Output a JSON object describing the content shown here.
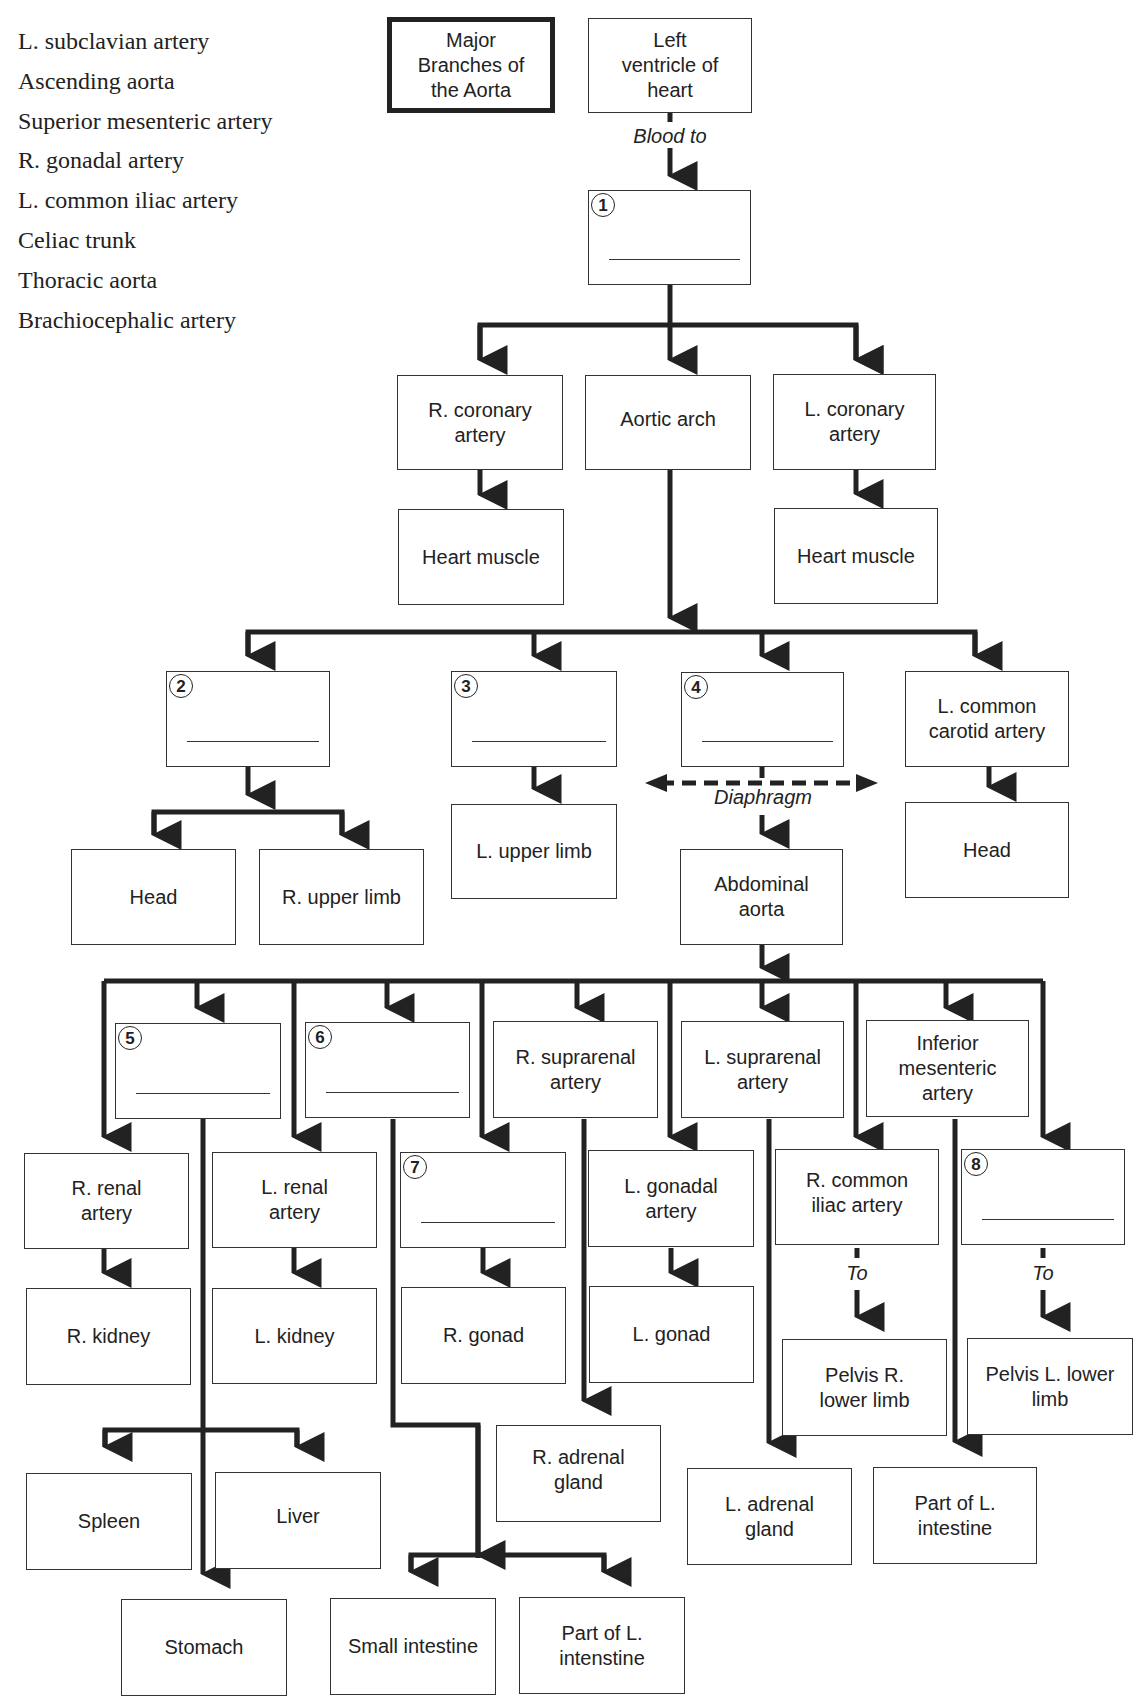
{
  "word_bank": [
    "L. subclavian artery",
    "Ascending aorta",
    "Superior mesenteric artery",
    "R. gonadal artery",
    "L. common iliac artery",
    "Celiac trunk",
    "Thoracic aorta",
    "Brachiocephalic artery"
  ],
  "title": "Major Branches of the Aorta",
  "labels": {
    "blood_to": "Blood to",
    "diaphragm": "Diaphragm",
    "to_right": "To",
    "to_left": "To"
  },
  "boxes": {
    "left_ventricle": "Left ventricle of heart",
    "r_coronary": "R. coronary artery",
    "aortic_arch": "Aortic arch",
    "l_coronary": "L. coronary artery",
    "heart_muscle_r": "Heart muscle",
    "heart_muscle_l": "Heart muscle",
    "l_common_carotid": "L. common carotid artery",
    "head_l": "Head",
    "head_r": "Head",
    "r_upper_limb": "R. upper limb",
    "l_upper_limb": "L. upper limb",
    "abdominal_aorta": "Abdominal aorta",
    "r_suprarenal": "R. suprarenal artery",
    "l_suprarenal": "L. suprarenal artery",
    "inferior_mesenteric": "Inferior mesenteric artery",
    "r_renal": "R. renal artery",
    "l_renal": "L. renal artery",
    "l_gonadal": "L. gonadal artery",
    "r_common_iliac": "R. common iliac artery",
    "r_kidney": "R. kidney",
    "l_kidney": "L. kidney",
    "r_gonad": "R. gonad",
    "l_gonad": "L. gonad",
    "pelvis_r": "Pelvis R. lower limb",
    "pelvis_l": "Pelvis L. lower limb",
    "r_adrenal": "R. adrenal gland",
    "l_adrenal": "L. adrenal gland",
    "part_l_intestine": "Part of L. intestine",
    "spleen": "Spleen",
    "liver": "Liver",
    "stomach": "Stomach",
    "small_intestine": "Small intestine",
    "part_l_intenstine": "Part of L. intenstine"
  },
  "blanks": [
    "1",
    "2",
    "3",
    "4",
    "5",
    "6",
    "7",
    "8"
  ]
}
